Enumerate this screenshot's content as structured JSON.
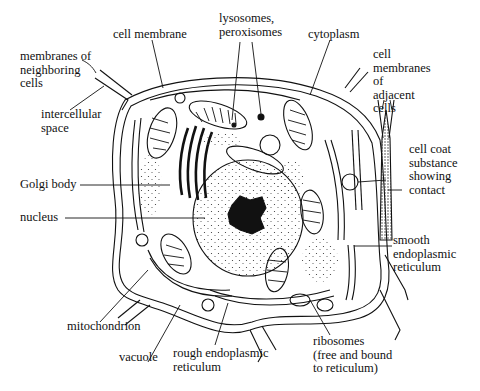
{
  "diagram": {
    "colors": {
      "ink": "#111111",
      "background": "#ffffff",
      "stipple": "#333333"
    },
    "labels": {
      "cell_membrane": "cell membrane",
      "lysosomes": "lysosomes,\nperoxisomes",
      "cytoplasm": "cytoplasm",
      "neighbor_membranes": "membranes of\nneighboring\ncells",
      "intercellular": "intercellular\nspace",
      "adjacent_membranes": "cell\nmembranes\nof\nadjacent\ncells",
      "cell_coat": "cell coat\nsubstance\nshowing\ncontact",
      "golgi": "Golgi body",
      "nucleus": "nucleus",
      "smooth_er": "smooth\nendoplasmic\nreticulum",
      "mitochondrion": "mitochondrion",
      "vacuole": "vacuole",
      "rough_er": "rough endoplasmic\nreticulum",
      "ribosomes": "ribosomes\n(free and bound\nto reticulum)"
    }
  }
}
